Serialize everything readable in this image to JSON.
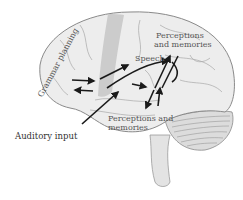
{
  "diagram": {
    "labels": {
      "grammar_planning": "Grammar planning",
      "speech": "Speech",
      "perceptions_upper_line1": "Perceptions",
      "perceptions_upper_line2": "and memories",
      "perceptions_lower_line1": "Perceptions and",
      "perceptions_lower_line2": "memories",
      "auditory_input": "Auditory input"
    },
    "structures": [
      "cerebrum",
      "motor strip (highlighted band)",
      "temporal lobe",
      "cerebellum",
      "brainstem"
    ],
    "arrows": [
      {
        "from": "grammar planning",
        "to": "speech area",
        "direction": "right"
      },
      {
        "from": "speech area",
        "to": "grammar planning",
        "direction": "left"
      },
      {
        "from": "auditory input",
        "to": "temporal region",
        "direction": "up-right"
      },
      {
        "from": "temporal region",
        "to": "speech",
        "direction": "up-right"
      },
      {
        "from": "central region",
        "to": "perceptions and memories (upper)",
        "direction": "up"
      },
      {
        "from": "central region",
        "to": "perceptions and memories (lower)",
        "direction": "down"
      }
    ],
    "colors": {
      "brain_fill": "#ececec",
      "brain_outline": "#8a8a8a",
      "motor_band": "#c4c4c4",
      "arrow": "#1a1a1a",
      "label_text": "#555555"
    }
  }
}
